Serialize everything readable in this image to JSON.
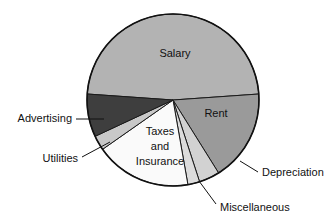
{
  "chart_data": {
    "type": "pie",
    "title": "",
    "subtitle": "",
    "xlabel": "",
    "ylabel": "",
    "legend_position": "none",
    "grid": false,
    "labels_placement": "slice-and-callout",
    "categories": [
      "Salary",
      "Rent",
      "Depreciation",
      "Miscellaneous",
      "Taxes and Insurance",
      "Utilities",
      "Advertising"
    ],
    "values": [
      48,
      17,
      4,
      2,
      17,
      3,
      9
    ],
    "units": "percent",
    "slices": [
      {
        "name": "Salary",
        "label": "Salary",
        "value": 48,
        "color": "#b3b3b3",
        "start_angle": 184,
        "end_angle": 356,
        "label_type": "inside",
        "label_x": 175,
        "label_y": 54
      },
      {
        "name": "Rent",
        "label": "Rent",
        "value": 17,
        "color": "#9a9a9a",
        "start_angle": 356,
        "end_angle": 418,
        "label_type": "inside",
        "label_x": 216,
        "label_y": 114
      },
      {
        "name": "Depreciation",
        "label": "Depreciation",
        "value": 4,
        "color": "#d2d2d2",
        "start_angle": 418,
        "end_angle": 432,
        "label_type": "callout",
        "label_x": 262,
        "label_y": 173,
        "leader_x1": 240,
        "leader_y1": 161,
        "leader_x2": 258,
        "leader_y2": 172
      },
      {
        "name": "Miscellaneous",
        "label": "Miscellaneous",
        "value": 2,
        "color": "#dcdcdc",
        "start_angle": 432,
        "end_angle": 440,
        "label_type": "callout",
        "label_x": 220,
        "label_y": 208,
        "leader_x1": 199,
        "leader_y1": 181,
        "leader_x2": 216,
        "leader_y2": 204
      },
      {
        "name": "Taxes and Insurance",
        "label_line1": "Taxes",
        "label_line2": "and",
        "label_line3": "Insurance",
        "value": 17,
        "color": "#fafafa",
        "start_angle": 440,
        "end_angle": 505,
        "label_type": "inside",
        "label_x": 160,
        "label_y": 132
      },
      {
        "name": "Utilities",
        "label": "Utilities",
        "value": 3,
        "color": "#c8c8c8",
        "start_angle": 505,
        "end_angle": 515,
        "label_type": "callout",
        "label_x": 78,
        "label_y": 159,
        "leader_x1": 110,
        "leader_y1": 142,
        "leader_x2": 82,
        "leader_y2": 157
      },
      {
        "name": "Advertising",
        "label": "Advertising",
        "value": 9,
        "color": "#3e3e3e",
        "start_angle": 515,
        "end_angle": 544,
        "label_type": "callout",
        "label_x": 72,
        "label_y": 119,
        "leader_x1": 104,
        "leader_y1": 119,
        "leader_x2": 76,
        "leader_y2": 119
      }
    ],
    "geometry": {
      "center_x": 173,
      "center_y": 100,
      "radius": 86
    },
    "colors": {
      "salary": "#b3b3b3",
      "rent": "#9a9a9a",
      "depreciation": "#d2d2d2",
      "miscellaneous": "#dcdcdc",
      "taxes_and_insurance": "#fafafa",
      "utilities": "#c8c8c8",
      "advertising": "#3e3e3e",
      "outline": "#111111",
      "background": "#ffffff",
      "text": "#111111"
    }
  }
}
